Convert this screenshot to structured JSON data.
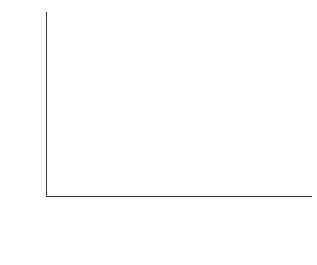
{
  "chart_data": {
    "type": "bar",
    "subtype": "stacked-bar",
    "title": "",
    "xlabel": "",
    "ylabel": "Percent",
    "ylim": [
      0,
      100
    ],
    "yticks": [
      0,
      20,
      40,
      60,
      80,
      100
    ],
    "ytick_labels": [
      "0",
      "20",
      "40",
      "60",
      "80",
      "100"
    ],
    "grid": true,
    "grid_axis": "y",
    "legend_position": "below-left",
    "categories": [
      "DotNet",
      "GenX",
      "Boomer",
      "Dutiful",
      "All"
    ],
    "series": [
      {
        "name": "Is necessary to protect",
        "color": "#3f3f3f",
        "stack_order": "bottom",
        "values": [
          65,
          60,
          54,
          53,
          57
        ],
        "labels": [
          "65",
          "60",
          "54",
          "53",
          "57"
        ]
      },
      {
        "name": "Does more harm than good",
        "color": "#e2e2e2",
        "stack_order": "top",
        "values": [
          29,
          30,
          34,
          34,
          32
        ],
        "labels": [
          "29",
          "30",
          "34",
          "34",
          "32"
        ]
      }
    ],
    "stack_totals": [
      94,
      90,
      88,
      87,
      89
    ]
  },
  "legend": {
    "items": [
      {
        "label": "Does more harm than good",
        "color": "#e2e2e2"
      },
      {
        "label": "Is necessary to protect",
        "color": "#3f3f3f"
      }
    ]
  },
  "colors": {
    "light_segment": "#e2e2e2",
    "dark_segment": "#3f3f3f",
    "axis": "#3a3a3a",
    "gridline": "#a9a9a9",
    "background": "#ffffff"
  }
}
